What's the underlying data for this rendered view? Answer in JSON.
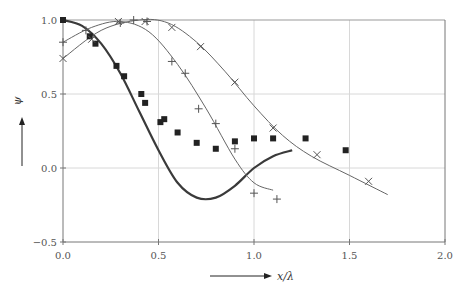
{
  "chart_data": {
    "type": "line",
    "title": "",
    "xlabel": "x/λ",
    "ylabel": "ψ",
    "xlim": [
      0,
      2.0
    ],
    "ylim": [
      -0.5,
      1.0
    ],
    "grid": true,
    "legend": null,
    "x_ticks": [
      "0.0",
      "0.5",
      "1.0",
      "1.5",
      "2.0"
    ],
    "y_ticks": [
      "1.0",
      "0.5",
      "0.0",
      "−0.5"
    ],
    "series": [
      {
        "name": "thick-curve",
        "kind": "line",
        "style": "thick",
        "x": [
          0.0,
          0.1,
          0.2,
          0.3,
          0.4,
          0.5,
          0.6,
          0.7,
          0.8,
          0.9,
          1.0,
          1.1,
          1.2
        ],
        "y": [
          1.0,
          0.96,
          0.84,
          0.64,
          0.38,
          0.12,
          -0.1,
          -0.2,
          -0.2,
          -0.12,
          0.0,
          0.08,
          0.12
        ]
      },
      {
        "name": "thin-curve-plus",
        "kind": "line",
        "style": "thin",
        "x": [
          0.0,
          0.15,
          0.3,
          0.45,
          0.6,
          0.75,
          0.9,
          1.0,
          1.1
        ],
        "y": [
          0.85,
          0.95,
          0.99,
          0.92,
          0.7,
          0.4,
          0.06,
          -0.1,
          -0.15
        ]
      },
      {
        "name": "thin-curve-cross",
        "kind": "line",
        "style": "thin",
        "x": [
          0.0,
          0.2,
          0.4,
          0.55,
          0.7,
          0.85,
          1.0,
          1.15,
          1.3,
          1.5,
          1.7
        ],
        "y": [
          0.74,
          0.93,
          1.0,
          0.98,
          0.85,
          0.65,
          0.42,
          0.22,
          0.08,
          -0.05,
          -0.18
        ]
      },
      {
        "name": "squares",
        "kind": "scatter",
        "marker": "square",
        "x": [
          0.0,
          0.14,
          0.17,
          0.28,
          0.32,
          0.41,
          0.43,
          0.51,
          0.53,
          0.6,
          0.7,
          0.8,
          0.9,
          1.0,
          1.1,
          1.27,
          1.48
        ],
        "y": [
          1.0,
          0.89,
          0.84,
          0.69,
          0.62,
          0.5,
          0.44,
          0.31,
          0.33,
          0.24,
          0.17,
          0.13,
          0.18,
          0.2,
          0.2,
          0.2,
          0.12
        ]
      },
      {
        "name": "plus-markers",
        "kind": "scatter",
        "marker": "plus",
        "x": [
          0.0,
          0.12,
          0.3,
          0.37,
          0.44,
          0.57,
          0.64,
          0.71,
          0.8,
          0.9,
          1.0,
          1.12
        ],
        "y": [
          0.85,
          0.93,
          0.98,
          1.0,
          0.99,
          0.72,
          0.64,
          0.4,
          0.3,
          0.13,
          -0.17,
          -0.21
        ]
      },
      {
        "name": "cross-markers",
        "kind": "scatter",
        "marker": "x",
        "x": [
          0.0,
          0.15,
          0.29,
          0.43,
          0.57,
          0.72,
          0.9,
          1.1,
          1.33,
          1.6
        ],
        "y": [
          0.74,
          0.87,
          0.99,
          0.99,
          0.95,
          0.82,
          0.58,
          0.27,
          0.09,
          -0.09
        ]
      }
    ]
  }
}
